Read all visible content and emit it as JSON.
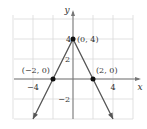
{
  "chart_data": {
    "type": "line",
    "title": "",
    "xlabel": "x",
    "ylabel": "y",
    "xlim": [
      -5,
      6
    ],
    "ylim": [
      -4,
      6
    ],
    "grid": true,
    "grid_step": 2,
    "x_ticks": [
      {
        "value": -4,
        "label": "−4"
      },
      {
        "value": 4,
        "label": "4"
      }
    ],
    "y_ticks": [
      {
        "value": 4,
        "label": "4"
      },
      {
        "value": 2,
        "label": "2"
      },
      {
        "value": -2,
        "label": "−2"
      }
    ],
    "series": [
      {
        "name": "y = 4 - 2|x|",
        "x": [
          -4,
          -2,
          0,
          2,
          4
        ],
        "y": [
          -4,
          0,
          4,
          0,
          -4
        ],
        "color": "#555555",
        "arrows_at_ends": true
      }
    ],
    "points": [
      {
        "x": 0,
        "y": 4,
        "label": "(0, 4)"
      },
      {
        "x": -2,
        "y": 0,
        "label": "(−2, 0)"
      },
      {
        "x": 2,
        "y": 0,
        "label": "(2, 0)"
      }
    ]
  },
  "colors": {
    "grid": "#d9d9d9",
    "axis": "#777777",
    "line": "#555555",
    "point": "#111111"
  }
}
